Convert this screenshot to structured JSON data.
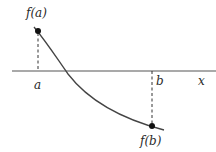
{
  "diagram": {
    "type": "function-graph",
    "labels": {
      "fa": "f(a)",
      "fb": "f(b)",
      "a": "a",
      "b": "b",
      "x": "x"
    },
    "colors": {
      "line": "#555555",
      "curve": "#444444",
      "dot": "#111111",
      "text": "#2a2a2a"
    },
    "points": {
      "fa": {
        "x": 38,
        "y": 31
      },
      "fb": {
        "x": 152,
        "y": 126
      }
    }
  }
}
